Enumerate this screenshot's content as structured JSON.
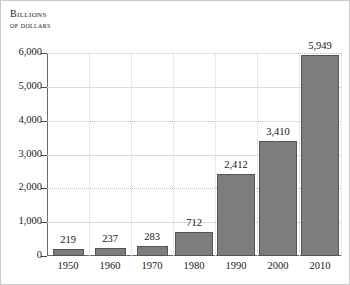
{
  "title": {
    "line1": "Billions",
    "line2": "of dollars"
  },
  "chart_data": {
    "type": "bar",
    "title": "Billions of dollars",
    "xlabel": "",
    "ylabel": "Billions of dollars",
    "categories": [
      "1950",
      "1960",
      "1970",
      "1980",
      "1990",
      "2000",
      "2010"
    ],
    "values": [
      219,
      237,
      283,
      712,
      2412,
      3410,
      5949
    ],
    "value_labels": [
      "219",
      "237",
      "283",
      "712",
      "2,412",
      "3,410",
      "5,949"
    ],
    "ylim": [
      0,
      6000
    ],
    "yticks": [
      0,
      1000,
      2000,
      3000,
      4000,
      5000,
      6000
    ],
    "ytick_labels": [
      "0",
      "1,000",
      "2,000",
      "3,000",
      "4,000",
      "5,000",
      "6,000"
    ],
    "grid": true,
    "grid_axis": "both",
    "legend": false,
    "legend_position": "none",
    "bar_color": "#7d7d7d",
    "bar_edge_color": "#555555",
    "axis_color": "#6b6b6b",
    "grid_color": "#c4c4c4",
    "background_color": "#ffffff",
    "text_color": "#1a1a1a",
    "bar_widths_px": [
      31,
      31,
      31,
      38,
      38,
      38,
      38
    ]
  }
}
